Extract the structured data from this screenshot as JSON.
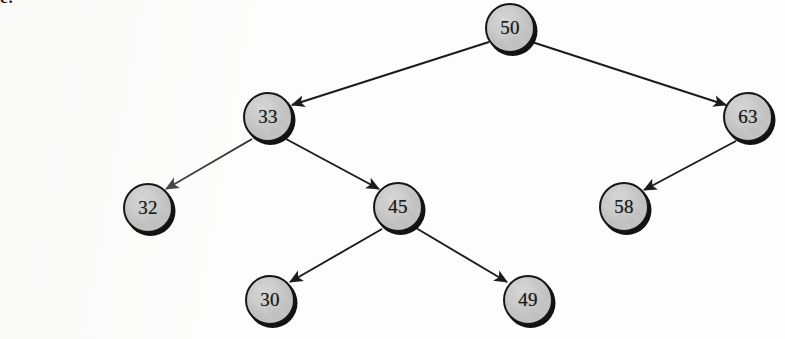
{
  "figure": {
    "kind": "binary-search-tree-diagram",
    "corner_label": "c.",
    "background_color": "#fdfdfd",
    "node_fill_color": "#c6c6c6",
    "node_stroke_color": "#161616",
    "node_shadow_color": "#121212",
    "edge_color": "#1b1b1b",
    "node_diameter": 50
  },
  "nodes": [
    {
      "id": "n50",
      "label": "50",
      "cx": 510,
      "cy": 28,
      "r": 25
    },
    {
      "id": "n33",
      "label": "33",
      "cx": 268,
      "cy": 117,
      "r": 25
    },
    {
      "id": "n63",
      "label": "63",
      "cx": 748,
      "cy": 117,
      "r": 25
    },
    {
      "id": "n32",
      "label": "32",
      "cx": 148,
      "cy": 208,
      "r": 25
    },
    {
      "id": "n45",
      "label": "45",
      "cx": 398,
      "cy": 207,
      "r": 25
    },
    {
      "id": "n58",
      "label": "58",
      "cx": 624,
      "cy": 207,
      "r": 25
    },
    {
      "id": "n30",
      "label": "30",
      "cx": 270,
      "cy": 300,
      "r": 25
    },
    {
      "id": "n49",
      "label": "49",
      "cx": 528,
      "cy": 300,
      "r": 25
    }
  ],
  "edges": [
    {
      "id": "e50-33",
      "from": "n50",
      "to": "n33",
      "x1": 489,
      "y1": 42,
      "x2": 292,
      "y2": 105,
      "arrow": true
    },
    {
      "id": "e50-63",
      "from": "n50",
      "to": "n63",
      "x1": 532,
      "y1": 42,
      "x2": 726,
      "y2": 105,
      "arrow": true
    },
    {
      "id": "e33-32",
      "from": "n33",
      "to": "n32",
      "x1": 252,
      "y1": 139,
      "x2": 166,
      "y2": 189,
      "arrow": true
    },
    {
      "id": "e33-45",
      "from": "n33",
      "to": "n45",
      "x1": 286,
      "y1": 139,
      "x2": 379,
      "y2": 189,
      "arrow": true
    },
    {
      "id": "e63-58",
      "from": "n63",
      "to": "n58",
      "x1": 736,
      "y1": 141,
      "x2": 644,
      "y2": 190,
      "arrow": true
    },
    {
      "id": "e45-30",
      "from": "n45",
      "to": "n30",
      "x1": 382,
      "y1": 229,
      "x2": 290,
      "y2": 282,
      "arrow": true
    },
    {
      "id": "e45-49",
      "from": "n45",
      "to": "n49",
      "x1": 416,
      "y1": 228,
      "x2": 507,
      "y2": 282,
      "arrow": true
    }
  ],
  "chart_data": {
    "type": "diagram",
    "root": "50",
    "tree": [
      {
        "value": "50",
        "left": "33",
        "right": "63"
      },
      {
        "value": "33",
        "left": "32",
        "right": "45"
      },
      {
        "value": "63",
        "left": "58",
        "right": null
      },
      {
        "value": "32",
        "left": null,
        "right": null
      },
      {
        "value": "45",
        "left": "30",
        "right": "49"
      },
      {
        "value": "58",
        "left": null,
        "right": null
      },
      {
        "value": "30",
        "left": null,
        "right": null
      },
      {
        "value": "49",
        "left": null,
        "right": null
      }
    ],
    "values": [
      50,
      33,
      63,
      32,
      45,
      58,
      30,
      49
    ]
  }
}
